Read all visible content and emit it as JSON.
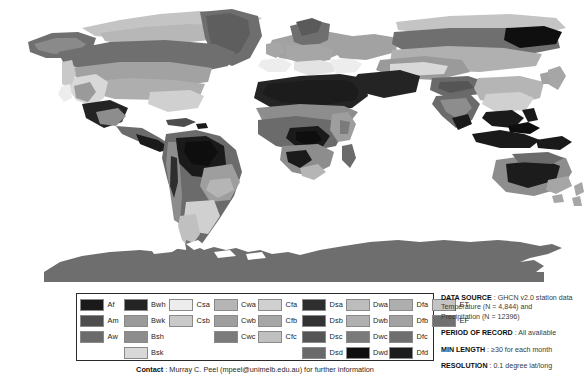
{
  "map": {
    "title": "koppen-geiger-climate-classification-world-map",
    "projection": "equirectangular",
    "ocean_color": "#ffffff",
    "antarctica_color": "#6e6e6e",
    "note": "grayscale world map of Koppen-Geiger climate zones"
  },
  "legend": {
    "columns": [
      {
        "name": "tropical",
        "entries": [
          {
            "code": "Af",
            "color": "#1a1a1a"
          },
          {
            "code": "Am",
            "color": "#4d4d4d"
          },
          {
            "code": "Aw",
            "color": "#6b6b6b"
          }
        ]
      },
      {
        "name": "arid",
        "entries": [
          {
            "code": "Bwh",
            "color": "#242424"
          },
          {
            "code": "Bwk",
            "color": "#9a9a9a"
          },
          {
            "code": "Bsh",
            "color": "#8d8d8d"
          },
          {
            "code": "Bsk",
            "color": "#d8d8d8"
          }
        ]
      },
      {
        "name": "temperate-dry-summer",
        "entries": [
          {
            "code": "Csa",
            "color": "#ededed"
          },
          {
            "code": "Csb",
            "color": "#c9c9c9"
          }
        ]
      },
      {
        "name": "temperate-dry-winter",
        "entries": [
          {
            "code": "Cwa",
            "color": "#b5b5b5"
          },
          {
            "code": "Cwb",
            "color": "#9e9e9e"
          },
          {
            "code": "Cwc",
            "color": "#7b7b7b"
          }
        ]
      },
      {
        "name": "temperate-no-dry-season",
        "entries": [
          {
            "code": "Cfa",
            "color": "#d0d0d0"
          },
          {
            "code": "Cfb",
            "color": "#a6a6a6"
          },
          {
            "code": "Cfc",
            "color": "#c0c0c0"
          }
        ]
      },
      {
        "name": "continental-dry-summer",
        "entries": [
          {
            "code": "Dsa",
            "color": "#2e2e2e"
          },
          {
            "code": "Dsb",
            "color": "#333333"
          },
          {
            "code": "Dsc",
            "color": "#555555"
          },
          {
            "code": "Dsd",
            "color": "#6a6a6a"
          }
        ]
      },
      {
        "name": "continental-dry-winter",
        "entries": [
          {
            "code": "Dwa",
            "color": "#bdbdbd"
          },
          {
            "code": "Dwb",
            "color": "#b0b0b0"
          },
          {
            "code": "Dwc",
            "color": "#7a7a7a"
          },
          {
            "code": "Dwd",
            "color": "#0f0f0f"
          }
        ]
      },
      {
        "name": "continental-no-dry-season",
        "entries": [
          {
            "code": "Dfa",
            "color": "#aeaeae"
          },
          {
            "code": "Dfb",
            "color": "#a2a2a2"
          },
          {
            "code": "Dfc",
            "color": "#6f6f6f"
          },
          {
            "code": "Dfd",
            "color": "#1c1c1c"
          }
        ]
      },
      {
        "name": "polar",
        "entries": [
          {
            "code": "ET",
            "color": "#c4c4c4"
          },
          {
            "code": "EF",
            "color": "#707070"
          }
        ]
      }
    ]
  },
  "contact": {
    "label": "Contact",
    "text": " : Murray C. Peel (mpeel@unimelb.edu.au) for further information"
  },
  "info": {
    "blocks": [
      {
        "key": "DATA SOURCE",
        "lines": [
          " : GHCN v2.0 station data",
          "Temperature (N = 4,844) and",
          "Precipitation (N = 12396)"
        ]
      },
      {
        "key": "PERIOD OF RECORD",
        "lines": [
          " : All available"
        ]
      },
      {
        "key": "MIN LENGTH",
        "lines": [
          " : ≥30 for each month"
        ]
      },
      {
        "key": "RESOLUTION",
        "lines": [
          " : 0.1 degree lat/long"
        ]
      }
    ]
  }
}
